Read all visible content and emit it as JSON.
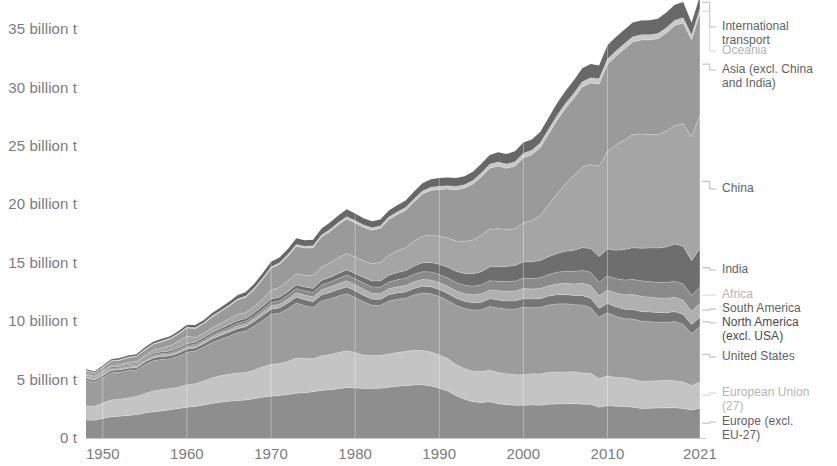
{
  "chart_data": {
    "type": "area",
    "title": "",
    "subtitle": "",
    "xlabel": "",
    "ylabel": "",
    "grid": false,
    "legend_position": "right-outside",
    "stacked": true,
    "xlim": [
      1948,
      2021
    ],
    "ylim": [
      0,
      37.5
    ],
    "y_tick_values": [
      0,
      5,
      10,
      15,
      20,
      25,
      30,
      35
    ],
    "y_tick_labels": [
      "0 t",
      "5 billion t",
      "10 billion t",
      "15 billion t",
      "20 billion t",
      "25 billion t",
      "30 billion t",
      "35 billion t"
    ],
    "x_tick_values": [
      1950,
      1960,
      1970,
      1980,
      1990,
      2000,
      2010,
      2021
    ],
    "x_tick_labels": [
      "1950",
      "1960",
      "1970",
      "1980",
      "1990",
      "2000",
      "2010",
      "2021"
    ],
    "unit": "billion t",
    "x": [
      1948,
      1949,
      1950,
      1951,
      1952,
      1953,
      1954,
      1955,
      1956,
      1957,
      1958,
      1959,
      1960,
      1961,
      1962,
      1963,
      1964,
      1965,
      1966,
      1967,
      1968,
      1969,
      1970,
      1971,
      1972,
      1973,
      1974,
      1975,
      1976,
      1977,
      1978,
      1979,
      1980,
      1981,
      1982,
      1983,
      1984,
      1985,
      1986,
      1987,
      1988,
      1989,
      1990,
      1991,
      1992,
      1993,
      1994,
      1995,
      1996,
      1997,
      1998,
      1999,
      2000,
      2001,
      2002,
      2003,
      2004,
      2005,
      2006,
      2007,
      2008,
      2009,
      2010,
      2011,
      2012,
      2013,
      2014,
      2015,
      2016,
      2017,
      2018,
      2019,
      2020,
      2021
    ],
    "series": [
      {
        "name": "Europe (excl. EU-27)",
        "color": "#8e8e8e",
        "values": [
          1.55,
          1.52,
          1.68,
          1.82,
          1.87,
          1.93,
          2.0,
          2.13,
          2.24,
          2.32,
          2.42,
          2.52,
          2.63,
          2.7,
          2.83,
          2.96,
          3.06,
          3.14,
          3.21,
          3.26,
          3.36,
          3.48,
          3.57,
          3.63,
          3.72,
          3.84,
          3.87,
          3.96,
          4.07,
          4.13,
          4.22,
          4.31,
          4.28,
          4.23,
          4.23,
          4.26,
          4.34,
          4.42,
          4.48,
          4.54,
          4.56,
          4.46,
          4.25,
          4.02,
          3.62,
          3.32,
          3.1,
          3.05,
          3.1,
          2.94,
          2.85,
          2.8,
          2.8,
          2.83,
          2.8,
          2.9,
          2.92,
          2.92,
          2.95,
          2.88,
          2.88,
          2.63,
          2.77,
          2.72,
          2.7,
          2.64,
          2.52,
          2.55,
          2.56,
          2.58,
          2.58,
          2.52,
          2.4,
          2.54
        ]
      },
      {
        "name": "European Union (27)",
        "color": "#c4c4c4",
        "values": [
          1.2,
          1.2,
          1.31,
          1.44,
          1.45,
          1.49,
          1.56,
          1.68,
          1.79,
          1.82,
          1.82,
          1.83,
          1.93,
          1.95,
          2.06,
          2.19,
          2.27,
          2.31,
          2.35,
          2.34,
          2.46,
          2.61,
          2.74,
          2.74,
          2.83,
          3.02,
          2.93,
          2.83,
          2.98,
          2.99,
          3.09,
          3.17,
          3.05,
          2.88,
          2.83,
          2.8,
          2.85,
          2.89,
          2.92,
          2.97,
          2.93,
          2.9,
          2.85,
          2.78,
          2.68,
          2.62,
          2.61,
          2.64,
          2.71,
          2.66,
          2.66,
          2.61,
          2.62,
          2.67,
          2.68,
          2.73,
          2.73,
          2.73,
          2.72,
          2.69,
          2.66,
          2.45,
          2.55,
          2.46,
          2.45,
          2.39,
          2.32,
          2.34,
          2.35,
          2.36,
          2.33,
          2.27,
          2.1,
          2.25
        ]
      },
      {
        "name": "United States",
        "color": "#9c9c9c",
        "values": [
          2.22,
          2.05,
          2.18,
          2.33,
          2.31,
          2.36,
          2.26,
          2.47,
          2.58,
          2.59,
          2.54,
          2.65,
          2.78,
          2.79,
          2.9,
          3.03,
          3.13,
          3.27,
          3.45,
          3.56,
          3.76,
          3.98,
          4.28,
          4.31,
          4.52,
          4.69,
          4.53,
          4.38,
          4.68,
          4.79,
          4.85,
          4.87,
          4.7,
          4.55,
          4.3,
          4.3,
          4.54,
          4.57,
          4.57,
          4.74,
          4.93,
          4.99,
          5.02,
          4.98,
          5.06,
          5.15,
          5.23,
          5.28,
          5.44,
          5.52,
          5.53,
          5.62,
          5.77,
          5.66,
          5.7,
          5.76,
          5.83,
          5.84,
          5.74,
          5.82,
          5.62,
          5.26,
          5.4,
          5.25,
          5.06,
          5.16,
          5.17,
          5.07,
          5.01,
          4.95,
          5.06,
          4.93,
          4.45,
          4.75
        ]
      },
      {
        "name": "North America (excl. USA)",
        "color": "#757575",
        "values": [
          0.17,
          0.17,
          0.18,
          0.2,
          0.2,
          0.2,
          0.2,
          0.22,
          0.24,
          0.25,
          0.25,
          0.26,
          0.27,
          0.27,
          0.29,
          0.3,
          0.32,
          0.34,
          0.35,
          0.37,
          0.39,
          0.41,
          0.44,
          0.45,
          0.48,
          0.51,
          0.51,
          0.5,
          0.52,
          0.54,
          0.55,
          0.58,
          0.57,
          0.55,
          0.52,
          0.51,
          0.53,
          0.54,
          0.53,
          0.55,
          0.58,
          0.59,
          0.59,
          0.59,
          0.6,
          0.61,
          0.63,
          0.65,
          0.67,
          0.69,
          0.7,
          0.71,
          0.74,
          0.73,
          0.74,
          0.76,
          0.78,
          0.79,
          0.79,
          0.81,
          0.8,
          0.76,
          0.79,
          0.8,
          0.81,
          0.82,
          0.83,
          0.83,
          0.82,
          0.83,
          0.85,
          0.85,
          0.77,
          0.81
        ]
      },
      {
        "name": "South America",
        "color": "#b0b0b0",
        "values": [
          0.08,
          0.08,
          0.09,
          0.1,
          0.1,
          0.1,
          0.11,
          0.12,
          0.13,
          0.14,
          0.14,
          0.15,
          0.16,
          0.17,
          0.18,
          0.19,
          0.2,
          0.21,
          0.23,
          0.24,
          0.26,
          0.28,
          0.3,
          0.32,
          0.35,
          0.38,
          0.4,
          0.41,
          0.45,
          0.47,
          0.49,
          0.53,
          0.53,
          0.52,
          0.51,
          0.49,
          0.51,
          0.52,
          0.55,
          0.57,
          0.58,
          0.59,
          0.6,
          0.62,
          0.64,
          0.66,
          0.69,
          0.72,
          0.76,
          0.8,
          0.83,
          0.84,
          0.87,
          0.87,
          0.87,
          0.88,
          0.93,
          0.96,
          0.99,
          1.04,
          1.09,
          1.07,
          1.15,
          1.19,
          1.24,
          1.28,
          1.3,
          1.27,
          1.24,
          1.24,
          1.22,
          1.22,
          1.13,
          1.18
        ]
      },
      {
        "name": "Africa",
        "color": "#8a8a8a",
        "values": [
          0.07,
          0.07,
          0.08,
          0.09,
          0.09,
          0.1,
          0.1,
          0.11,
          0.12,
          0.12,
          0.13,
          0.14,
          0.15,
          0.15,
          0.16,
          0.17,
          0.18,
          0.2,
          0.21,
          0.22,
          0.24,
          0.26,
          0.28,
          0.3,
          0.32,
          0.35,
          0.36,
          0.38,
          0.41,
          0.43,
          0.46,
          0.49,
          0.51,
          0.53,
          0.54,
          0.55,
          0.58,
          0.6,
          0.62,
          0.64,
          0.66,
          0.68,
          0.69,
          0.7,
          0.71,
          0.72,
          0.74,
          0.77,
          0.79,
          0.81,
          0.83,
          0.85,
          0.87,
          0.89,
          0.92,
          0.96,
          1.0,
          1.04,
          1.07,
          1.11,
          1.15,
          1.17,
          1.21,
          1.22,
          1.26,
          1.29,
          1.32,
          1.33,
          1.34,
          1.35,
          1.38,
          1.4,
          1.34,
          1.4
        ]
      },
      {
        "name": "India",
        "color": "#6e6e6e",
        "values": [
          0.08,
          0.08,
          0.09,
          0.1,
          0.1,
          0.11,
          0.11,
          0.12,
          0.13,
          0.14,
          0.14,
          0.15,
          0.16,
          0.17,
          0.18,
          0.2,
          0.21,
          0.22,
          0.23,
          0.24,
          0.25,
          0.27,
          0.28,
          0.29,
          0.31,
          0.32,
          0.33,
          0.35,
          0.38,
          0.4,
          0.42,
          0.44,
          0.45,
          0.48,
          0.51,
          0.54,
          0.58,
          0.62,
          0.66,
          0.71,
          0.76,
          0.82,
          0.87,
          0.92,
          0.96,
          1.0,
          1.05,
          1.13,
          1.18,
          1.24,
          1.28,
          1.34,
          1.4,
          1.43,
          1.48,
          1.53,
          1.61,
          1.7,
          1.81,
          1.94,
          2.03,
          2.2,
          2.32,
          2.44,
          2.61,
          2.7,
          2.79,
          2.87,
          2.94,
          3.05,
          3.19,
          3.22,
          2.99,
          3.3
        ]
      },
      {
        "name": "China",
        "color": "#a5a5a5",
        "values": [
          0.11,
          0.11,
          0.12,
          0.14,
          0.16,
          0.19,
          0.21,
          0.23,
          0.28,
          0.32,
          0.46,
          0.58,
          0.63,
          0.41,
          0.37,
          0.4,
          0.44,
          0.49,
          0.57,
          0.5,
          0.51,
          0.62,
          0.76,
          0.84,
          0.89,
          0.96,
          0.99,
          1.11,
          1.14,
          1.23,
          1.36,
          1.4,
          1.41,
          1.41,
          1.48,
          1.58,
          1.72,
          1.86,
          1.96,
          2.12,
          2.28,
          2.36,
          2.4,
          2.51,
          2.6,
          2.75,
          2.89,
          3.11,
          3.22,
          3.25,
          3.19,
          3.13,
          3.35,
          3.51,
          3.83,
          4.46,
          5.1,
          5.79,
          6.41,
          6.92,
          7.19,
          7.72,
          8.35,
          9.0,
          9.37,
          9.68,
          9.78,
          9.72,
          9.7,
          9.92,
          10.13,
          10.49,
          10.6,
          11.47
        ]
      },
      {
        "name": "Asia (excl. China and India)",
        "color": "#9a9a9a",
        "values": [
          0.26,
          0.26,
          0.3,
          0.35,
          0.37,
          0.4,
          0.42,
          0.46,
          0.51,
          0.55,
          0.57,
          0.62,
          0.7,
          0.76,
          0.83,
          0.93,
          1.01,
          1.1,
          1.22,
          1.32,
          1.49,
          1.68,
          1.88,
          1.99,
          2.14,
          2.35,
          2.34,
          2.37,
          2.58,
          2.7,
          2.82,
          2.96,
          2.92,
          2.88,
          2.87,
          2.92,
          3.05,
          3.11,
          3.2,
          3.38,
          3.61,
          3.81,
          4.0,
          4.2,
          4.38,
          4.56,
          4.8,
          5.02,
          5.23,
          5.38,
          5.22,
          5.38,
          5.58,
          5.66,
          5.83,
          6.05,
          6.3,
          6.45,
          6.6,
          6.85,
          6.98,
          7.05,
          7.45,
          7.6,
          7.8,
          7.95,
          8.05,
          8.1,
          8.22,
          8.4,
          8.58,
          8.64,
          8.3,
          8.62
        ]
      },
      {
        "name": "Oceania",
        "color": "#c9c9c9",
        "values": [
          0.03,
          0.03,
          0.04,
          0.04,
          0.04,
          0.04,
          0.05,
          0.05,
          0.05,
          0.06,
          0.06,
          0.06,
          0.07,
          0.07,
          0.07,
          0.08,
          0.08,
          0.09,
          0.09,
          0.1,
          0.11,
          0.11,
          0.12,
          0.13,
          0.14,
          0.15,
          0.16,
          0.16,
          0.17,
          0.18,
          0.19,
          0.2,
          0.2,
          0.21,
          0.21,
          0.21,
          0.22,
          0.23,
          0.24,
          0.25,
          0.26,
          0.27,
          0.28,
          0.28,
          0.29,
          0.3,
          0.31,
          0.32,
          0.33,
          0.34,
          0.36,
          0.37,
          0.38,
          0.39,
          0.4,
          0.41,
          0.42,
          0.42,
          0.43,
          0.44,
          0.44,
          0.44,
          0.45,
          0.45,
          0.45,
          0.45,
          0.45,
          0.45,
          0.45,
          0.45,
          0.45,
          0.45,
          0.43,
          0.44
        ]
      },
      {
        "name": "International transport",
        "color": "#686868",
        "values": [
          0.12,
          0.12,
          0.13,
          0.14,
          0.15,
          0.15,
          0.16,
          0.17,
          0.18,
          0.19,
          0.19,
          0.2,
          0.22,
          0.23,
          0.24,
          0.26,
          0.28,
          0.3,
          0.32,
          0.34,
          0.37,
          0.4,
          0.44,
          0.46,
          0.49,
          0.53,
          0.52,
          0.52,
          0.56,
          0.58,
          0.6,
          0.63,
          0.6,
          0.57,
          0.55,
          0.54,
          0.56,
          0.57,
          0.6,
          0.63,
          0.66,
          0.68,
          0.7,
          0.7,
          0.71,
          0.73,
          0.75,
          0.78,
          0.81,
          0.84,
          0.86,
          0.89,
          0.93,
          0.92,
          0.94,
          0.97,
          1.03,
          1.07,
          1.11,
          1.16,
          1.18,
          1.14,
          1.18,
          1.2,
          1.2,
          1.21,
          1.22,
          1.24,
          1.26,
          1.29,
          1.32,
          1.33,
          1.04,
          1.1
        ]
      }
    ]
  },
  "axes": {
    "y_labels": [
      {
        "text": "35 billion t",
        "value": 35
      },
      {
        "text": "30 billion t",
        "value": 30
      },
      {
        "text": "25 billion t",
        "value": 25
      },
      {
        "text": "20 billion t",
        "value": 20
      },
      {
        "text": "15 billion t",
        "value": 15
      },
      {
        "text": "10 billion t",
        "value": 10
      },
      {
        "text": "5 billion t",
        "value": 5
      },
      {
        "text": "0 t",
        "value": 0
      }
    ],
    "x_labels": [
      {
        "text": "1950",
        "value": 1950
      },
      {
        "text": "1960",
        "value": 1960
      },
      {
        "text": "1970",
        "value": 1970
      },
      {
        "text": "1980",
        "value": 1980
      },
      {
        "text": "1990",
        "value": 1990
      },
      {
        "text": "2000",
        "value": 2000
      },
      {
        "text": "2010",
        "value": 2010
      },
      {
        "text": "2021",
        "value": 2021
      }
    ]
  },
  "legend": {
    "items": [
      {
        "label": "International\ntransport",
        "tone": "normal",
        "y": 20
      },
      {
        "label": "Oceania",
        "tone": "faint",
        "y": 44
      },
      {
        "label": "Asia (excl. China\nand India)",
        "tone": "normal",
        "y": 63
      },
      {
        "label": "China",
        "tone": "normal",
        "y": 182
      },
      {
        "label": "India",
        "tone": "normal",
        "y": 263
      },
      {
        "label": "Africa",
        "tone": "faint",
        "y": 288
      },
      {
        "label": "South America",
        "tone": "normal",
        "y": 302
      },
      {
        "label": "North America\n(excl. USA)",
        "tone": "strong",
        "y": 316
      },
      {
        "label": "United States",
        "tone": "normal",
        "y": 350
      },
      {
        "label": "European Union\n(27)",
        "tone": "faint",
        "y": 386
      },
      {
        "label": "Europe (excl.\nEU-27)",
        "tone": "normal",
        "y": 415
      }
    ]
  }
}
